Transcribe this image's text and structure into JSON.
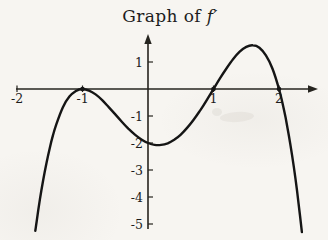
{
  "figure": {
    "title_prefix": "Graph of ",
    "title_math": "f′"
  },
  "chart_data": {
    "type": "line",
    "title": "Graph of f′",
    "function": "f'(x) = -(x+1)^2 (x-1)(x-2)",
    "xlabel": "",
    "ylabel": "",
    "x_range": [
      -2,
      2.45
    ],
    "y_range": [
      -5.3,
      2.1
    ],
    "grid": false,
    "legend": "none",
    "x_ticks": [
      {
        "value": -2,
        "label": "-2"
      },
      {
        "value": -1,
        "label": "-1"
      },
      {
        "value": 1,
        "label": "1"
      },
      {
        "value": 2,
        "label": "2"
      }
    ],
    "y_ticks": [
      {
        "value": 1,
        "label": "1"
      },
      {
        "value": -1,
        "label": "-1"
      },
      {
        "value": -2,
        "label": "-2"
      },
      {
        "value": -3,
        "label": "-3"
      },
      {
        "value": -4,
        "label": "-4"
      },
      {
        "value": -5,
        "label": "-5"
      }
    ],
    "zeros": [
      -1,
      1,
      2
    ],
    "marked_points": [
      [
        -1,
        0
      ],
      [
        1,
        0
      ],
      [
        2,
        0
      ]
    ],
    "local_min": [
      0.16,
      -2.08
    ],
    "local_max": [
      1.59,
      1.62
    ],
    "points": [
      [
        -1.72,
        -5.25
      ],
      [
        -1.7,
        -4.9
      ],
      [
        -1.65,
        -4.09
      ],
      [
        -1.6,
        -3.37
      ],
      [
        -1.55,
        -2.74
      ],
      [
        -1.5,
        -2.19
      ],
      [
        -1.45,
        -1.71
      ],
      [
        -1.4,
        -1.31
      ],
      [
        -1.3,
        -0.68
      ],
      [
        -1.2,
        -0.28
      ],
      [
        -1.1,
        -0.07
      ],
      [
        -1.0,
        0
      ],
      [
        -0.9,
        -0.06
      ],
      [
        -0.8,
        -0.2
      ],
      [
        -0.7,
        -0.41
      ],
      [
        -0.6,
        -0.67
      ],
      [
        -0.5,
        -0.94
      ],
      [
        -0.4,
        -1.21
      ],
      [
        -0.3,
        -1.47
      ],
      [
        -0.2,
        -1.69
      ],
      [
        -0.1,
        -1.87
      ],
      [
        0,
        -2.0
      ],
      [
        0.1,
        -2.07
      ],
      [
        0.2,
        -2.07
      ],
      [
        0.3,
        -2.01
      ],
      [
        0.4,
        -1.88
      ],
      [
        0.5,
        -1.69
      ],
      [
        0.6,
        -1.43
      ],
      [
        0.7,
        -1.13
      ],
      [
        0.8,
        -0.78
      ],
      [
        0.9,
        -0.4
      ],
      [
        1.0,
        0
      ],
      [
        1.1,
        0.4
      ],
      [
        1.2,
        0.77
      ],
      [
        1.3,
        1.11
      ],
      [
        1.4,
        1.38
      ],
      [
        1.5,
        1.56
      ],
      [
        1.6,
        1.62
      ],
      [
        1.7,
        1.53
      ],
      [
        1.8,
        1.25
      ],
      [
        1.9,
        0.76
      ],
      [
        2.0,
        0
      ],
      [
        2.05,
        -0.49
      ],
      [
        2.1,
        -1.06
      ],
      [
        2.15,
        -1.71
      ],
      [
        2.2,
        -2.46
      ],
      [
        2.25,
        -3.3
      ],
      [
        2.3,
        -4.25
      ],
      [
        2.35,
        -5.3
      ]
    ]
  },
  "style": {
    "background": "#f7f5f1",
    "ink": "#1c1c1c",
    "curve_color": "#151515",
    "axis_color": "#26241f"
  }
}
